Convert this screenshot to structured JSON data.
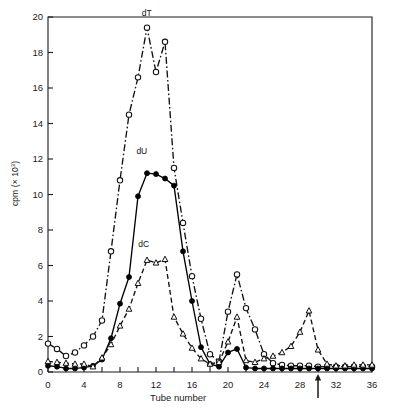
{
  "chart_data": {
    "type": "line",
    "title": "",
    "xlabel": "Tube number",
    "ylabel": "cpm (× 10³)",
    "ylabel_base": "cpm (× 10",
    "ylabel_exp": "3",
    "ylabel_close": ")",
    "xlim": [
      0,
      36
    ],
    "ylim": [
      0,
      20
    ],
    "xticks": [
      0,
      4,
      8,
      12,
      16,
      20,
      24,
      28,
      32,
      36
    ],
    "xticks_labels": [
      "0",
      "4",
      "8",
      "12",
      "16",
      "20",
      "24",
      "28",
      "32",
      "36"
    ],
    "xtick_minor_step": 2,
    "yticks": [
      0,
      2,
      4,
      6,
      8,
      10,
      12,
      14,
      16,
      18,
      20
    ],
    "yticks_labels": [
      "0",
      "2",
      "4",
      "6",
      "8",
      "10",
      "12",
      "14",
      "16",
      "18",
      "20"
    ],
    "grid": false,
    "legend_position": "inline-annotations",
    "annotations": [
      {
        "text": "dT",
        "x": 11.2,
        "y": 19.9,
        "name": "series-label-dT"
      },
      {
        "text": "dU",
        "x": 10.6,
        "y": 12.1,
        "name": "series-label-dU"
      },
      {
        "text": "dC",
        "x": 10.8,
        "y": 6.9,
        "name": "series-label-dC"
      }
    ],
    "markers": [
      {
        "type": "arrow-up",
        "axis": "x",
        "x": 30.0,
        "name": "x-axis-arrow-marker"
      }
    ],
    "x": [
      0,
      1,
      2,
      3,
      4,
      5,
      6,
      7,
      8,
      9,
      10,
      11,
      12,
      13,
      14,
      15,
      16,
      17,
      18,
      19,
      20,
      21,
      22,
      23,
      24,
      25,
      26,
      27,
      28,
      29,
      30,
      31,
      32,
      33,
      34,
      35,
      36
    ],
    "series": [
      {
        "name": "dT",
        "marker": "open-circle",
        "linestyle": "dash-dot",
        "color": "#111111",
        "values": [
          1.6,
          1.3,
          0.9,
          1.1,
          1.5,
          2.0,
          2.9,
          6.8,
          10.8,
          14.5,
          16.6,
          19.4,
          16.9,
          18.6,
          11.5,
          8.4,
          5.4,
          3.0,
          1.0,
          0.6,
          3.4,
          5.5,
          3.6,
          2.4,
          1.0,
          0.5,
          0.4,
          0.35,
          0.35,
          0.35,
          0.3,
          0.3,
          0.3,
          0.3,
          0.3,
          0.3,
          0.3
        ]
      },
      {
        "name": "dU",
        "marker": "filled-circle",
        "linestyle": "solid",
        "color": "#000000",
        "values": [
          0.35,
          0.3,
          0.2,
          0.2,
          0.25,
          0.35,
          0.7,
          1.9,
          3.85,
          5.35,
          9.9,
          11.2,
          11.15,
          10.9,
          10.5,
          6.8,
          4.0,
          1.4,
          0.45,
          0.3,
          1.1,
          1.3,
          0.25,
          0.2,
          0.2,
          0.2,
          0.2,
          0.2,
          0.2,
          0.2,
          0.2,
          0.2,
          0.2,
          0.2,
          0.2,
          0.2,
          0.2
        ]
      },
      {
        "name": "dC",
        "marker": "open-triangle",
        "linestyle": "dashed",
        "color": "#111111",
        "values": [
          0.6,
          0.55,
          0.5,
          0.45,
          0.45,
          0.3,
          0.8,
          1.55,
          2.6,
          3.55,
          5.0,
          6.3,
          6.15,
          6.35,
          3.1,
          2.15,
          1.35,
          0.75,
          0.45,
          0.55,
          1.7,
          3.1,
          0.65,
          0.55,
          0.75,
          0.9,
          1.1,
          1.45,
          2.25,
          3.45,
          1.25,
          0.45,
          0.35,
          0.35,
          0.4,
          0.4,
          0.4
        ]
      }
    ]
  }
}
